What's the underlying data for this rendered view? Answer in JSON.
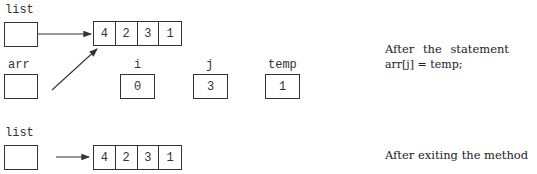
{
  "top_diagram": {
    "list_label": "list",
    "array": [
      "4",
      "2",
      "3",
      "1"
    ],
    "arr_label": "arr",
    "i_label": "i",
    "i_value": "0",
    "j_label": "j",
    "j_value": "3",
    "temp_label": "temp",
    "temp_value": "1",
    "caption_line1": "After the statement",
    "caption_line2": "arr[j] = temp;"
  },
  "bottom_diagram": {
    "list_label": "list",
    "array": [
      "4",
      "2",
      "3",
      "1"
    ],
    "caption": "After exiting the method"
  }
}
